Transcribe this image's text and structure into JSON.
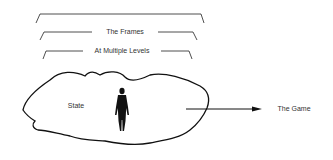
{
  "diagram": {
    "brackets": [
      {
        "label": ""
      },
      {
        "label": "The Frames"
      },
      {
        "label": "At Multiple Levels"
      }
    ],
    "blob_label": "State",
    "figure": "person-silhouette",
    "arrow_target": "The Game"
  },
  "colors": {
    "stroke": "#111111",
    "text": "#333333",
    "background": "#ffffff"
  }
}
